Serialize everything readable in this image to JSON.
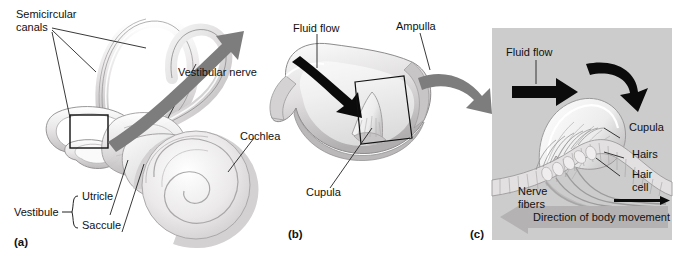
{
  "figure": {
    "background": "#ffffff",
    "width": 686,
    "height": 257
  },
  "colors": {
    "ink": "#111111",
    "leader_line": "#222222",
    "transition_arrow": "#7d7d7d",
    "panel_c_background": "#cccccc",
    "movement_band": "#b4b4b4",
    "black_arrow": "#0b0b0b",
    "tissue_light": "#eceaea",
    "tissue_mid": "#d4d2d2",
    "tissue_dark": "#a9a7a7",
    "outline": "#8d8b8b"
  },
  "panels": [
    {
      "id": "a",
      "mark": "(a)",
      "name": "inner-ear-overview",
      "labels": [
        {
          "key": "semicircular_canals",
          "text": "Semicircular\ncanals",
          "line1": "Semicircular",
          "line2": "canals"
        },
        {
          "key": "vestibular_nerve",
          "text": "Vestibular nerve"
        },
        {
          "key": "cochlea",
          "text": "Cochlea"
        },
        {
          "key": "vestibule",
          "text": "Vestibule"
        },
        {
          "key": "utricle",
          "text": "Utricle"
        },
        {
          "key": "saccule",
          "text": "Saccule"
        }
      ]
    },
    {
      "id": "b",
      "mark": "(b)",
      "name": "ampulla-cutaway",
      "labels": [
        {
          "key": "fluid_flow",
          "text": "Fluid flow"
        },
        {
          "key": "ampulla",
          "text": "Ampulla"
        },
        {
          "key": "cupula",
          "text": "Cupula"
        }
      ]
    },
    {
      "id": "c",
      "mark": "(c)",
      "name": "cupula-hair-cell-detail",
      "labels": [
        {
          "key": "fluid_flow",
          "text": "Fluid flow"
        },
        {
          "key": "cupula",
          "text": "Cupula"
        },
        {
          "key": "hairs",
          "text": "Hairs"
        },
        {
          "key": "hair_cell_l1",
          "text": "Hair"
        },
        {
          "key": "hair_cell_l2",
          "text": "cell"
        },
        {
          "key": "nerve_fibers_l1",
          "text": "Nerve"
        },
        {
          "key": "nerve_fibers_l2",
          "text": "fibers"
        },
        {
          "key": "direction_band",
          "text": "Direction of body movement"
        }
      ]
    }
  ],
  "icons": {
    "transition_arrow_a_to_b": "curved-arrow-icon",
    "transition_arrow_b_to_c": "curved-arrow-icon",
    "fluid_flow_arrow_b": "black-arrow-icon",
    "fluid_flow_arrow_c": "black-arrow-icon",
    "cupula_deflection_arrow_c": "curved-black-arrow-icon",
    "movement_direction_arrow": "left-band-arrow-icon",
    "nerve_signal_arrow": "right-arrow-icon",
    "callout_box_a": "callout-box-icon",
    "callout_box_b": "callout-box-icon"
  }
}
